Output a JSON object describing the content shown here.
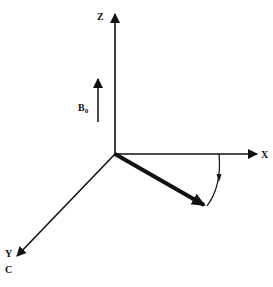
{
  "diagram": {
    "type": "3d-coordinate-axes",
    "axes": {
      "z": {
        "label": "Z"
      },
      "x": {
        "label": "X"
      },
      "y": {
        "label": "Y"
      }
    },
    "field": {
      "label_main": "B",
      "label_sub": "0"
    },
    "corner_label": "C",
    "colors": {
      "ink": "#111111",
      "background": "#ffffff"
    }
  }
}
